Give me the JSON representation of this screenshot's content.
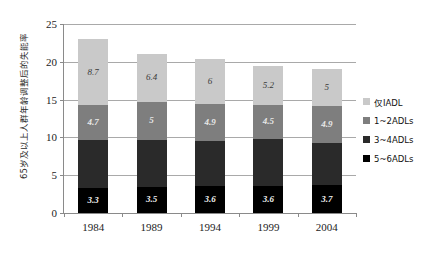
{
  "chart_data": {
    "type": "bar",
    "subtype": "stacked-bar",
    "title": "",
    "xlabel": "",
    "ylabel": "65岁及以上人群年龄调整后的失能率",
    "categories": [
      "1984",
      "1989",
      "1994",
      "1999",
      "2004"
    ],
    "ylim": [
      0,
      25
    ],
    "yticks": [
      "0",
      "5",
      "10",
      "15",
      "20",
      "25"
    ],
    "ytick_values": [
      0,
      5,
      10,
      15,
      20,
      25
    ],
    "grid": true,
    "legend_position": "right",
    "stack_order_bottom_to_top": [
      "5~6ADLs",
      "3~4ADLs",
      "1~2ADLs",
      "仅IADL"
    ],
    "series": [
      {
        "name": "仅IADL",
        "color": "#c9c9c9",
        "values": [
          8.7,
          6.4,
          6,
          5.2,
          5
        ],
        "labels": [
          "8.7",
          "6.4",
          "6",
          "5.2",
          "5"
        ],
        "labels_shown": true
      },
      {
        "name": "1~2ADLs",
        "color": "#7e7e7e",
        "values": [
          4.7,
          5,
          4.9,
          4.5,
          4.9
        ],
        "labels": [
          "4.7",
          "5",
          "4.9",
          "4.5",
          "4.9"
        ],
        "labels_shown": true
      },
      {
        "name": "3~4ADLs",
        "color": "#2a2a2a",
        "values": [
          6.3,
          6.2,
          5.9,
          6.2,
          5.5
        ],
        "labels": [
          "",
          "",
          "",
          "",
          ""
        ],
        "labels_shown": false
      },
      {
        "name": "5~6ADLs",
        "color": "#000000",
        "values": [
          3.3,
          3.5,
          3.6,
          3.6,
          3.7
        ],
        "labels": [
          "3.3",
          "3.5",
          "3.6",
          "3.6",
          "3.7"
        ],
        "labels_shown": true
      }
    ],
    "totals": [
      23.0,
      21.1,
      20.4,
      19.5,
      19.1
    ]
  },
  "legend": {
    "items": [
      {
        "label": "仅IADL",
        "color": "#c9c9c9"
      },
      {
        "label": "1~2ADLs",
        "color": "#7e7e7e"
      },
      {
        "label": "3~4ADLs",
        "color": "#2a2a2a"
      },
      {
        "label": "5~6ADLs",
        "color": "#000000"
      }
    ]
  }
}
